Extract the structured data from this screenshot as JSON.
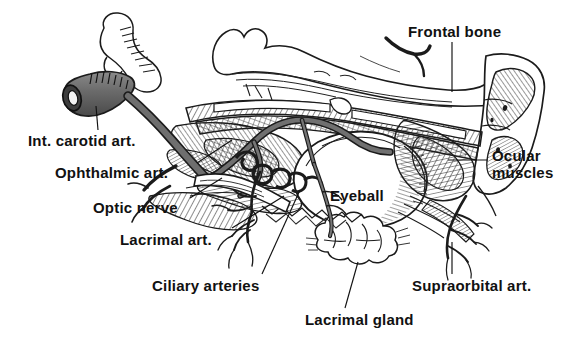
{
  "figure": {
    "type": "anatomical-illustration",
    "style": "pen-and-ink line engraving, black on white",
    "background_color": "#ffffff",
    "ink_color": "#111111",
    "artery_fill_color": "#6e6e6e"
  },
  "labels": {
    "int_carotid": "Int. carotid art.",
    "ophthalmic": "Ophthalmic art.",
    "optic_nerve": "Optic nerve",
    "lacrimal_art": "Lacrimal art.",
    "ciliary": "Ciliary arteries",
    "lacrimal_gland": "Lacrimal gland",
    "eyeball": "Eyeball",
    "frontal_bone": "Frontal bone",
    "ocular_line1": "Ocular",
    "ocular_line2": "muscles",
    "supraorbital": "Supraorbital art."
  }
}
